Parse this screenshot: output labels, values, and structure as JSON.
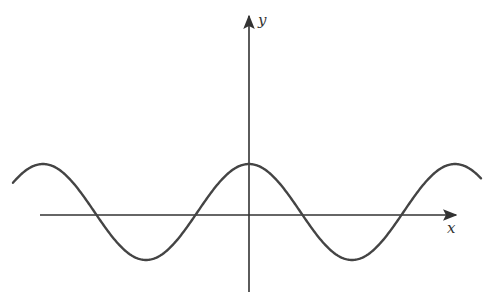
{
  "chart_data": {
    "type": "line",
    "title": "",
    "xlabel": "x",
    "ylabel": "y",
    "grid": false,
    "legend": null,
    "function": "cosine wave, y = A cos(x)",
    "key_points_px": {
      "peak_center": [
        249,
        164
      ],
      "trough_right": [
        347,
        260
      ],
      "trough_left": [
        146,
        262
      ],
      "peak_left": [
        43,
        166
      ],
      "peak_right": [
        455,
        166
      ],
      "zero_crossings": [
        92,
        198,
        300,
        400
      ]
    },
    "axes": {
      "x_axis": {
        "y": 215,
        "x_start": 40,
        "x_end": 458
      },
      "y_axis": {
        "x": 249,
        "y_start": 292,
        "y_end": 14
      }
    }
  },
  "labels": {
    "x": "x",
    "y": "y"
  },
  "colors": {
    "curve": "#444444",
    "axes": "#333333"
  }
}
